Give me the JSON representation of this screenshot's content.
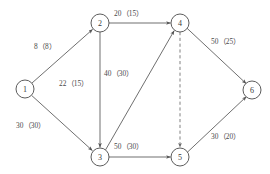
{
  "diagram": {
    "type": "directed-network-graph",
    "background_color": "#ffffff",
    "node_stroke_color": "#4a4a4a",
    "edge_stroke_color": "#555555",
    "dashed_edge_color": "#6a6a6a",
    "nodes": [
      {
        "id": "1",
        "label": "1",
        "cx": 25,
        "cy": 89,
        "r": 9
      },
      {
        "id": "2",
        "label": "2",
        "cx": 100,
        "cy": 23,
        "r": 9
      },
      {
        "id": "3",
        "label": "3",
        "cx": 100,
        "cy": 157,
        "r": 9
      },
      {
        "id": "4",
        "label": "4",
        "cx": 180,
        "cy": 23,
        "r": 9
      },
      {
        "id": "5",
        "label": "5",
        "cx": 180,
        "cy": 157,
        "r": 9
      },
      {
        "id": "6",
        "label": "6",
        "cx": 252,
        "cy": 90,
        "r": 9
      }
    ],
    "edges": [
      {
        "id": "e12",
        "from": "1",
        "to": "2",
        "label": "8（8）",
        "style": "solid",
        "arrow": true,
        "label_x": 34,
        "label_y": 43
      },
      {
        "id": "e13",
        "from": "1",
        "to": "3",
        "label": "30（30）",
        "style": "solid",
        "arrow": true,
        "label_x": 16,
        "label_y": 122
      },
      {
        "id": "e24",
        "from": "2",
        "to": "4",
        "label": "20（15）",
        "style": "solid",
        "arrow": true,
        "label_x": 114,
        "label_y": 10
      },
      {
        "id": "e23",
        "from": "2",
        "to": "3",
        "label": "40（30）",
        "style": "solid",
        "arrow": true,
        "label_x": 104,
        "label_y": 70
      },
      {
        "id": "e34",
        "from": "3",
        "to": "4",
        "label": "22（15）",
        "style": "solid",
        "arrow": true,
        "label_x": 59,
        "label_y": 80
      },
      {
        "id": "e35",
        "from": "3",
        "to": "5",
        "label": "50（30）",
        "style": "solid",
        "arrow": true,
        "label_x": 114,
        "label_y": 143
      },
      {
        "id": "e45",
        "from": "4",
        "to": "5",
        "label": "",
        "style": "dashed",
        "arrow": true,
        "label_x": 0,
        "label_y": 0
      },
      {
        "id": "e46",
        "from": "4",
        "to": "6",
        "label": "50（25）",
        "style": "solid",
        "arrow": true,
        "label_x": 211,
        "label_y": 38
      },
      {
        "id": "e56",
        "from": "5",
        "to": "6",
        "label": "30（20）",
        "style": "solid",
        "arrow": true,
        "label_x": 211,
        "label_y": 133
      }
    ]
  }
}
